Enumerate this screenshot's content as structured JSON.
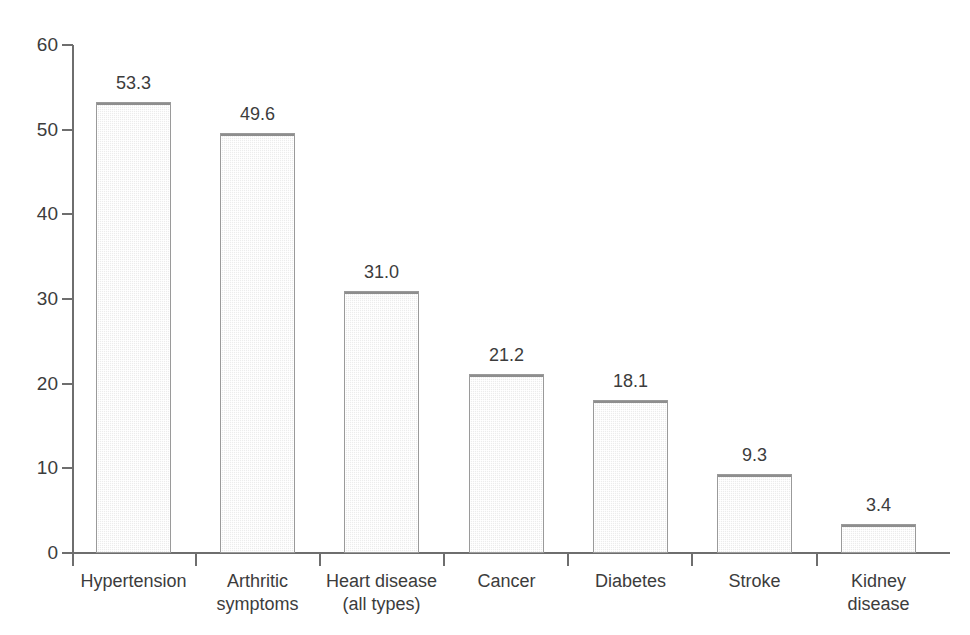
{
  "chart_data": {
    "type": "bar",
    "title": "",
    "subtitle": "",
    "xlabel": "",
    "ylabel": "",
    "ylim": [
      0,
      60
    ],
    "ytick_step": 10,
    "ytick_labels": [
      "0",
      "10",
      "20",
      "30",
      "40",
      "50",
      "60"
    ],
    "grid": false,
    "legend": null,
    "value_labels_shown": true,
    "categories": [
      "Hypertension",
      "Arthritic\nsymptoms",
      "Heart disease\n(all types)",
      "Cancer",
      "Diabetes",
      "Stroke",
      "Kidney\ndisease"
    ],
    "values": [
      53.3,
      49.6,
      31.0,
      21.2,
      18.1,
      9.3,
      3.4
    ],
    "value_label_text": [
      "53.3",
      "49.6",
      "31.0",
      "21.2",
      "18.1",
      "9.3",
      "3.4"
    ],
    "colors": {
      "bar_fill": "#ececec",
      "bar_border": "#9a9a9a",
      "axis": "#6e6e6e",
      "text": "#3c3c3c",
      "background": "#ffffff"
    }
  }
}
